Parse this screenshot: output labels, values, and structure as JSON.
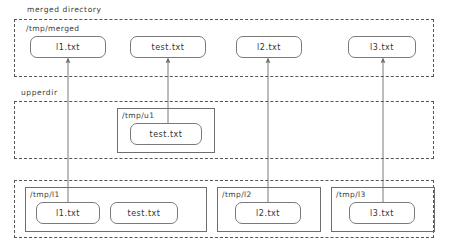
{
  "diagram": {
    "sections": [
      {
        "key": "merged",
        "label": "merged directory",
        "path": "/tmp/merged",
        "files": [
          "l1.txt",
          "test.txt",
          "l2.txt",
          "l3.txt"
        ]
      },
      {
        "key": "upper",
        "label": "upperdir",
        "dirs": [
          {
            "path": "/tmp/u1",
            "files": [
              "test.txt"
            ]
          }
        ]
      },
      {
        "key": "lower",
        "label": "",
        "dirs": [
          {
            "path": "/tmp/l1",
            "files": [
              "l1.txt",
              "test.txt"
            ]
          },
          {
            "path": "/tmp/l2",
            "files": [
              "l2.txt"
            ]
          },
          {
            "path": "/tmp/l3",
            "files": [
              "l3.txt"
            ]
          }
        ]
      }
    ]
  },
  "labels": {
    "merged_section": "merged directory",
    "merged_path": "/tmp/merged",
    "upper_section": "upperdir",
    "upper_dir_path": "/tmp/u1",
    "lower_dir1_path": "/tmp/l1",
    "lower_dir2_path": "/tmp/l2",
    "lower_dir3_path": "/tmp/l3"
  },
  "merged_files": {
    "f1": "l1.txt",
    "f2": "test.txt",
    "f3": "l2.txt",
    "f4": "l3.txt"
  },
  "upper_files": {
    "u1_f1": "test.txt"
  },
  "lower_files": {
    "l1_f1": "l1.txt",
    "l1_f2": "test.txt",
    "l2_f1": "l2.txt",
    "l3_f1": "l3.txt"
  },
  "colors": {
    "dashed_border": "#555555",
    "solid_border": "#6e6e6e",
    "file_border": "#7a7a7a",
    "text": "#333333",
    "arrow": "#777777",
    "background": "#ffffff"
  },
  "arrows": [
    {
      "name": "l1-lower-to-merged",
      "from_x": 68,
      "from_y": 210,
      "to_x": 68,
      "to_y": 60
    },
    {
      "name": "test-upper-to-merged",
      "from_x": 168,
      "from_y": 130,
      "to_x": 168,
      "to_y": 60
    },
    {
      "name": "l2-lower-to-merged",
      "from_x": 268,
      "from_y": 210,
      "to_x": 268,
      "to_y": 60
    },
    {
      "name": "l3-lower-to-merged",
      "from_x": 383,
      "from_y": 210,
      "to_x": 383,
      "to_y": 60
    }
  ]
}
